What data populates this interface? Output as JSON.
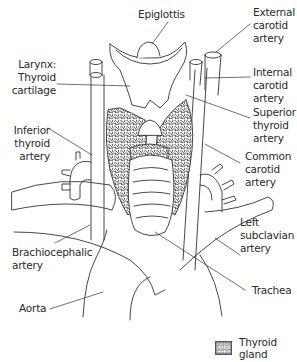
{
  "figure": {
    "type": "anatomical-diagram",
    "line_color": "#333333",
    "background": "#ffffff"
  },
  "labels": {
    "epiglottis": "Epiglottis",
    "external_carotid": "External\ncarotid\nartery",
    "larynx": "Larynx:\nThyroid\ncartilage",
    "internal_carotid": "Internal\ncarotid\nartery",
    "superior_thyroid": "Superior\nthyroid\nartery",
    "inferior_thyroid": "Inferior\nthyroid\nartery",
    "common_carotid": "Common\ncarotid\nartery",
    "left_subclavian": "Left\nsubclavian\nartery",
    "brachiocephalic": "Brachiocephalic\nartery",
    "trachea": "Trachea",
    "aorta": "Aorta"
  },
  "legend": {
    "items": [
      {
        "label": "Thyroid gland",
        "pattern": "stippled-texture"
      }
    ]
  }
}
